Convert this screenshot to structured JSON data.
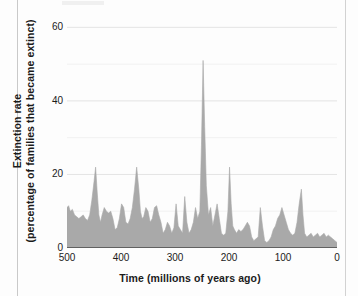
{
  "chart_data": {
    "type": "area",
    "title": "",
    "xlabel": "Time  (millions of years ago)",
    "ylabel_line1": "Extinction rate",
    "ylabel_line2": "(percentage of families that became extinct)",
    "xlim": [
      500,
      0
    ],
    "ylim": [
      0,
      62
    ],
    "x_ticks": [
      500,
      400,
      300,
      200,
      100,
      0
    ],
    "y_ticks": [
      0,
      20,
      40,
      60
    ],
    "x_axis_reversed": true,
    "grid": "horizontal-faint",
    "legend": "none",
    "fill_color": "#a9a9a9",
    "series_name": "Extinction rate",
    "x": [
      500,
      497,
      494,
      490,
      486,
      482,
      478,
      474,
      470,
      466,
      462,
      458,
      454,
      450,
      447,
      444,
      441,
      438,
      435,
      431,
      427,
      423,
      419,
      415,
      411,
      407,
      403,
      399,
      395,
      391,
      387,
      383,
      379,
      375,
      371,
      367,
      364,
      361,
      358,
      354,
      350,
      346,
      342,
      338,
      334,
      330,
      326,
      322,
      318,
      314,
      310,
      306,
      302,
      298,
      294,
      290,
      286,
      282,
      278,
      274,
      270,
      266,
      262,
      258,
      254,
      251,
      248,
      245,
      242,
      238,
      234,
      230,
      226,
      222,
      218,
      214,
      210,
      206,
      202,
      199,
      196,
      193,
      190,
      186,
      182,
      178,
      174,
      170,
      166,
      162,
      158,
      154,
      150,
      146,
      142,
      138,
      134,
      130,
      126,
      122,
      118,
      114,
      110,
      106,
      102,
      98,
      94,
      90,
      86,
      82,
      78,
      74,
      70,
      66,
      63,
      60,
      56,
      52,
      48,
      44,
      40,
      36,
      32,
      28,
      24,
      20,
      16,
      12,
      8,
      4,
      0
    ],
    "values": [
      11,
      11.5,
      10,
      10.5,
      9,
      8.5,
      8,
      8.5,
      9,
      8,
      7.5,
      9,
      13,
      18,
      22,
      15,
      9,
      7,
      9,
      11,
      10,
      9.5,
      10,
      8,
      5,
      5.5,
      8,
      12,
      11,
      7,
      6.5,
      8,
      11,
      16,
      22,
      16,
      10,
      8,
      8.5,
      11,
      10,
      7,
      8,
      11,
      11.5,
      9,
      7,
      4,
      5,
      7,
      6,
      4,
      5.5,
      12,
      6,
      5,
      4,
      14,
      7,
      4,
      5,
      7,
      11,
      8,
      10,
      28,
      51,
      33,
      17,
      9,
      11,
      6,
      9,
      12,
      8,
      4,
      3.5,
      4,
      10,
      22,
      12,
      6,
      5,
      4,
      5,
      4.5,
      5,
      6,
      7,
      6,
      3,
      2,
      2.5,
      3,
      11,
      6,
      2,
      1.5,
      2,
      3,
      5,
      6,
      8,
      9,
      11,
      9,
      7,
      5,
      4,
      3.5,
      4,
      7,
      12,
      16,
      9,
      4,
      3,
      3.5,
      4,
      3,
      3.5,
      4,
      3,
      3.5,
      4,
      3,
      3.5,
      3,
      2.5,
      2,
      1.5
    ],
    "annotations": [
      {
        "label": "end-Ordovician",
        "x": 447,
        "y": 22
      },
      {
        "label": "late Devonian",
        "x": 371,
        "y": 22
      },
      {
        "label": "end-Permian",
        "x": 251,
        "y": 51
      },
      {
        "label": "end-Triassic",
        "x": 199,
        "y": 22
      },
      {
        "label": "end-Cretaceous",
        "x": 63,
        "y": 16
      }
    ]
  }
}
